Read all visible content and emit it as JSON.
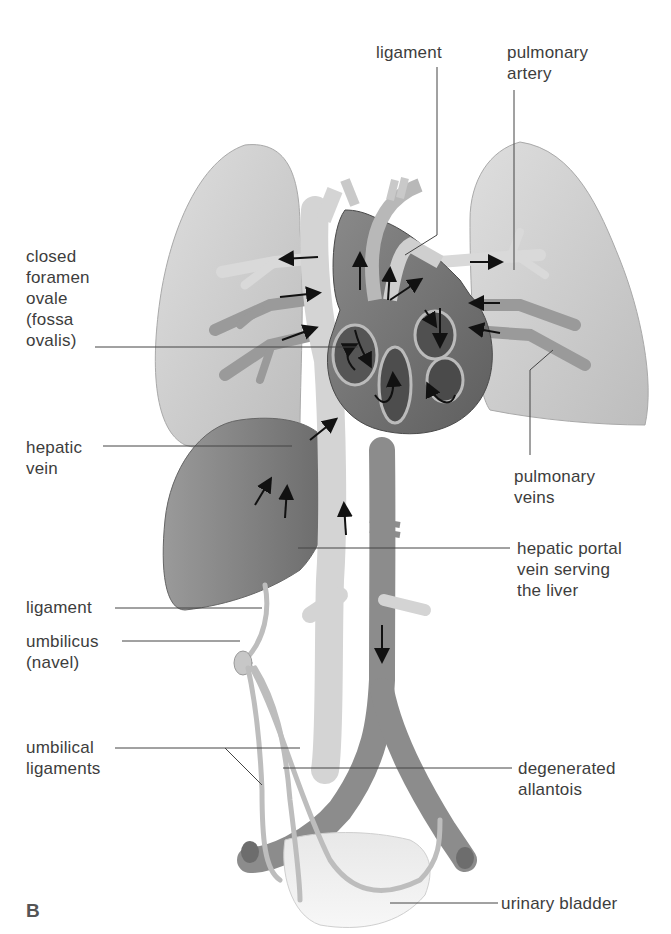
{
  "figure": {
    "panel_letter": "B",
    "colors": {
      "background": "#ffffff",
      "lung": "#cfcfcf",
      "heart_dark": "#6e6e6e",
      "vessel_light": "#d6d6d6",
      "vessel_dark": "#8a8a8a",
      "liver": "#7d7d7d",
      "label_text": "#3d3d3d",
      "leader_line": "#444444",
      "arrow": "#111111"
    }
  },
  "labels": {
    "ligament_top": "ligament",
    "pulmonary_artery": "pulmonary\nartery",
    "closed_foramen_ovale": "closed\nforamen\novale\n(fossa\novalis)",
    "hepatic_vein": "hepatic\nvein",
    "pulmonary_veins": "pulmonary\nveins",
    "hepatic_portal_vein": "hepatic portal\nvein serving\nthe liver",
    "ligament_left": "ligament",
    "umbilicus": "umbilicus\n(navel)",
    "umbilical_ligaments": "umbilical\nligaments",
    "degenerated_allantois": "degenerated\nallantois",
    "urinary_bladder": "urinary bladder"
  }
}
